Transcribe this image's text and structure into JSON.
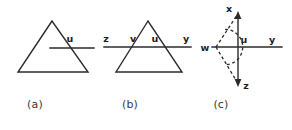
{
  "figure": {
    "background_color": "#ffffff",
    "stroke_color": "#2b2b2b",
    "label_color": "#1d1d1d",
    "caption_color": "#3a3a3a",
    "panel_count": 3
  },
  "panels": [
    {
      "id": "a",
      "caption": "(a)",
      "description": "Triangle with a horizontal line crossing its right side",
      "shapes": [
        {
          "kind": "triangle",
          "apex": [
            52,
            21
          ],
          "base_left": [
            18,
            72
          ],
          "base_right": [
            88,
            72
          ]
        },
        {
          "kind": "line",
          "from": [
            50,
            48
          ],
          "to": [
            94,
            48
          ],
          "style": "solid"
        }
      ],
      "vertex_labels": [
        {
          "text": "u",
          "x": 70,
          "y": 42
        }
      ]
    },
    {
      "id": "b",
      "caption": "(b)",
      "description": "Triangle with a horizontal transversal line crossing both sides, labeled z v u y",
      "shapes": [
        {
          "kind": "triangle",
          "apex": [
            148,
            21
          ],
          "base_left": [
            116,
            72
          ],
          "base_right": [
            182,
            72
          ]
        },
        {
          "kind": "line",
          "from": [
            104,
            47
          ],
          "to": [
            191,
            47
          ],
          "style": "solid"
        }
      ],
      "vertex_labels": [
        {
          "text": "z",
          "x": 106,
          "y": 42
        },
        {
          "text": "v",
          "x": 133,
          "y": 42
        },
        {
          "text": "u",
          "x": 155,
          "y": 42
        },
        {
          "text": "y",
          "x": 186,
          "y": 42
        }
      ]
    },
    {
      "id": "c",
      "caption": "(c)",
      "description": "Vertical double arrow x-z crossed by ray u-y, with dashed triangle from w and a dashed angle arc",
      "shapes": [
        {
          "kind": "arrow_line",
          "from": [
            238,
            14
          ],
          "to": [
            238,
            84
          ],
          "style": "solid",
          "arrow_start": true,
          "arrow_end": true
        },
        {
          "kind": "line",
          "from": [
            213,
            47
          ],
          "to": [
            282,
            47
          ],
          "style": "solid"
        },
        {
          "kind": "line",
          "from": [
            216,
            47
          ],
          "to": [
            236,
            16
          ],
          "style": "dashed"
        },
        {
          "kind": "line",
          "from": [
            216,
            47
          ],
          "to": [
            236,
            81
          ],
          "style": "dashed"
        },
        {
          "kind": "arc",
          "center": [
            216,
            47
          ],
          "radius": 14,
          "style": "dashed"
        }
      ],
      "vertex_labels": [
        {
          "text": "x",
          "x": 229,
          "y": 12
        },
        {
          "text": "w",
          "x": 205,
          "y": 51
        },
        {
          "text": "u",
          "x": 242,
          "y": 43
        },
        {
          "text": "y",
          "x": 272,
          "y": 43
        },
        {
          "text": "z",
          "x": 244,
          "y": 88
        }
      ]
    }
  ],
  "captions": [
    {
      "text": "(a)",
      "x": 35,
      "y": 104
    },
    {
      "text": "(b)",
      "x": 130,
      "y": 104
    },
    {
      "text": "(c)",
      "x": 221,
      "y": 104
    }
  ]
}
